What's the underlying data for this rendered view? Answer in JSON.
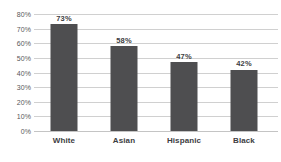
{
  "chart_data": {
    "type": "bar",
    "title": "",
    "subtitle": "",
    "xlabel": "",
    "ylabel": "",
    "categories": [
      "White",
      "Asian",
      "Hispanic",
      "Black"
    ],
    "values": [
      73,
      58,
      47,
      42
    ],
    "value_labels": [
      "73%",
      "58%",
      "47%",
      "42%"
    ],
    "ylim": [
      0,
      80
    ],
    "ytick_values": [
      0,
      10,
      20,
      30,
      40,
      50,
      60,
      70,
      80
    ],
    "ytick_labels": [
      "0%",
      "10%",
      "20%",
      "30%",
      "40%",
      "50%",
      "60%",
      "70%",
      "80%"
    ],
    "grid": true,
    "legend": false,
    "legend_position": "none",
    "series": [
      {
        "name": "",
        "values": [
          73,
          58,
          47,
          42
        ]
      }
    ],
    "colors": {
      "bar": "#4e4e50",
      "gridline": "#d0d0d0",
      "baseline": "#c4c4c4",
      "tick_text": "#58585a",
      "label_text": "#3d3d3f",
      "background": "#ffffff"
    }
  }
}
